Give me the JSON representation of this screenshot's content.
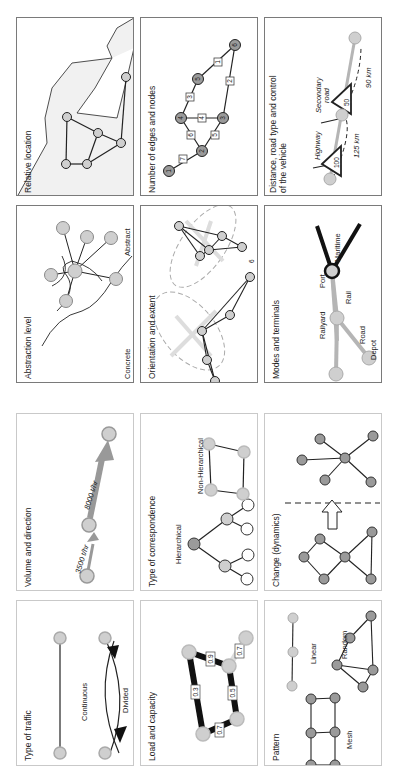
{
  "figure": {
    "orientation": "rotated 90deg counter-clockwise",
    "panels": {
      "relative_location": {
        "title": "Relative location"
      },
      "number_of_edges_and_nodes": {
        "title": "Number of edges and nodes",
        "nodes": [
          "1",
          "2",
          "3",
          "4",
          "5",
          "6"
        ],
        "edges": [
          "1",
          "2",
          "3",
          "4",
          "5",
          "6",
          "7"
        ]
      },
      "distance_road_type": {
        "title_line1": "Distance, road type and control",
        "title_line2": "of the vehicle",
        "highway_label": "Highway",
        "highway_speed": "100",
        "highway_distance": "125 km",
        "secondary_label_line1": "Secondary",
        "secondary_label_line2": "road",
        "secondary_speed": "50",
        "secondary_distance": "90 km"
      },
      "abstraction_level": {
        "title": "Abstraction level",
        "concrete_label": "Concrete",
        "abstract_label": "Abstract"
      },
      "orientation_and_extent": {
        "title": "Orientation and extent",
        "mark": "6"
      },
      "modes_and_terminals": {
        "title": "Modes and terminals",
        "port": "Port",
        "maritime": "Maritime",
        "rail": "Rail",
        "railyard": "Railyard",
        "road": "Road",
        "depot": "Depot"
      },
      "volume_and_direction": {
        "title": "Volume and direction",
        "flow_1": "3500 t/hr",
        "flow_2": "8000 t/hr"
      },
      "type_of_correspondence": {
        "title": "Type of correspondence",
        "hierarchical": "Hierarchical",
        "non_hierarchical": "Non-Hierarchical"
      },
      "change_dynamics": {
        "title": "Change (dynamics)"
      },
      "type_of_traffic": {
        "title": "Type of traffic",
        "continuous": "Continuous",
        "divided": "Divided"
      },
      "load_and_capacity": {
        "title": "Load and capacity",
        "loads": [
          "0.3",
          "0.9",
          "0.7",
          "0.5",
          "0.7"
        ]
      },
      "pattern": {
        "title": "Pattern",
        "linear": "Linear",
        "random": "Random",
        "mesh": "Mesh"
      }
    },
    "colors": {
      "node_fill": "#cfcfcf",
      "node_dark_fill": "#9a9a9a",
      "border": "#7a7a7a",
      "light_border": "#c9c9c9",
      "edge": "#222222",
      "rail_gray": "#b5b5b5"
    }
  }
}
